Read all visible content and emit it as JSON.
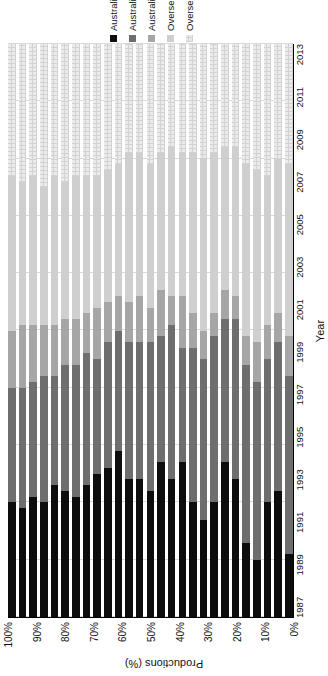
{
  "chart": {
    "type": "bar",
    "title": "",
    "value_axis_title": "Productions (%)",
    "category_axis_title": "Year",
    "value_ticks": [
      "0%",
      "10%",
      "20%",
      "30%",
      "40%",
      "50%",
      "60%",
      "70%",
      "80%",
      "90%",
      "100%"
    ],
    "orientation": "rotated-90-horizontal-stacked"
  },
  "legend": {
    "position": "bottom",
    "items": [
      {
        "label": "Australian New",
        "color": "#0d0d0d"
      },
      {
        "label": "Australian Recent",
        "color": "#6e6e6e"
      },
      {
        "label": "Australian Classic",
        "color": "#a6a6a6"
      },
      {
        "label": "Overseas classic",
        "color": "#cfcfcf"
      },
      {
        "label": "Overseas recent",
        "color": "#ebebeb"
      }
    ]
  },
  "chart_data": {
    "type": "bar",
    "title": "",
    "xlabel": "Year",
    "ylabel": "Productions (%)",
    "ylim": [
      0,
      100
    ],
    "grid": true,
    "stacked": true,
    "normalized_percent": true,
    "legend_position": "bottom",
    "categories": [
      "1987",
      "1988",
      "1989",
      "1990",
      "1991",
      "1992",
      "1993",
      "1994",
      "1995",
      "1996",
      "1997",
      "1998",
      "1999",
      "2000",
      "2001",
      "2002",
      "2003",
      "2004",
      "2005",
      "2006",
      "2007",
      "2008",
      "2009",
      "2010",
      "2011",
      "2012",
      "2013"
    ],
    "tick_labels": [
      "1987",
      "1989",
      "1991",
      "1993",
      "1995",
      "1997",
      "1999",
      "2001",
      "2003",
      "2005",
      "2007",
      "2009",
      "2011",
      "2013"
    ],
    "series": [
      {
        "name": "Australian New",
        "color": "#0d0d0d",
        "values": [
          20,
          19,
          21,
          20,
          23,
          22,
          21,
          23,
          25,
          26,
          29,
          24,
          24,
          22,
          27,
          24,
          27,
          20,
          17,
          20,
          27,
          24,
          13,
          10,
          20,
          22,
          11
        ]
      },
      {
        "name": "Australian Recent",
        "color": "#6e6e6e",
        "values": [
          20,
          21,
          20,
          22,
          19,
          22,
          23,
          23,
          20,
          22,
          21,
          24,
          24,
          26,
          22,
          27,
          20,
          27,
          28,
          29,
          25,
          28,
          31,
          31,
          25,
          26,
          31
        ]
      },
      {
        "name": "Australian Classic",
        "color": "#a6a6a6",
        "values": [
          10,
          11,
          10,
          9,
          9,
          8,
          8,
          7,
          9,
          7,
          6,
          7,
          8,
          6,
          8,
          5,
          9,
          6,
          5,
          4,
          5,
          4,
          5,
          7,
          6,
          5,
          7
        ]
      },
      {
        "name": "Overseas classic",
        "color": "#cfcfcf",
        "values": [
          27,
          25,
          26,
          24,
          26,
          24,
          25,
          24,
          23,
          23,
          23,
          26,
          25,
          25,
          24,
          26,
          25,
          28,
          30,
          28,
          25,
          26,
          30,
          30,
          26,
          27,
          30
        ]
      },
      {
        "name": "Overseas recent",
        "color": "#ebebeb",
        "values": [
          23,
          24,
          23,
          25,
          23,
          24,
          23,
          23,
          23,
          22,
          21,
          19,
          19,
          21,
          19,
          18,
          19,
          19,
          20,
          19,
          18,
          18,
          21,
          22,
          23,
          20,
          21
        ]
      }
    ]
  }
}
